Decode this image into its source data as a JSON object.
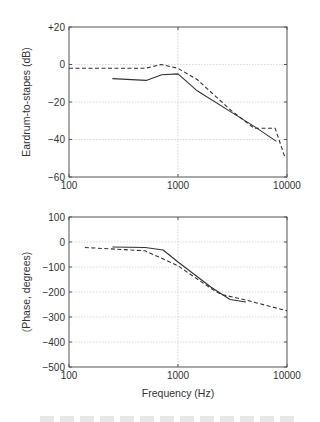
{
  "chart_data": [
    {
      "type": "line",
      "title": "",
      "xlabel": "",
      "ylabel": "Eardrum-to-stapes (dB)",
      "xscale": "log",
      "xlim": [
        100,
        10000
      ],
      "ylim": [
        -60,
        20
      ],
      "xticks": [
        100,
        1000,
        10000
      ],
      "xtick_labels": [
        "100",
        "1000",
        "10000"
      ],
      "yticks": [
        20,
        0,
        -20,
        -40,
        -60
      ],
      "ytick_labels": [
        "+20",
        "0",
        "−20",
        "−40",
        "−60"
      ],
      "grid": true,
      "legend": null,
      "series": [
        {
          "name": "solid",
          "style": "solid",
          "x": [
            250,
            510,
            710,
            1000,
            1500,
            3000,
            5000,
            8000
          ],
          "y": [
            -7.5,
            -8.5,
            -5.5,
            -5,
            -14,
            -25,
            -33,
            -41
          ]
        },
        {
          "name": "dashed",
          "style": "dashed",
          "x": [
            100,
            500,
            700,
            1000,
            1500,
            3000,
            5000,
            7800,
            9500
          ],
          "y": [
            -2,
            -2,
            0,
            -2,
            -8,
            -24,
            -34,
            -34,
            -49
          ]
        }
      ]
    },
    {
      "type": "line",
      "title": "",
      "xlabel": "Frequency (Hz)",
      "ylabel": "(Phase, degrees)",
      "xscale": "log",
      "xlim": [
        100,
        10000
      ],
      "ylim": [
        -500,
        100
      ],
      "xticks": [
        100,
        1000,
        10000
      ],
      "xtick_labels": [
        "100",
        "1000",
        "10000"
      ],
      "yticks": [
        100,
        0,
        -100,
        -200,
        -300,
        -400,
        -500
      ],
      "ytick_labels": [
        "100",
        "0",
        "−100",
        "−200",
        "−300",
        "−400",
        "−500"
      ],
      "grid": true,
      "legend": null,
      "series": [
        {
          "name": "solid",
          "style": "solid",
          "x": [
            250,
            500,
            730,
            1000,
            2000,
            3000,
            4200
          ],
          "y": [
            -20,
            -22,
            -32,
            -80,
            -180,
            -230,
            -240
          ]
        },
        {
          "name": "dashed",
          "style": "dashed",
          "x": [
            140,
            500,
            1000,
            2000,
            2500,
            4000,
            10000
          ],
          "y": [
            -22,
            -35,
            -95,
            -185,
            -210,
            -230,
            -275
          ]
        }
      ]
    }
  ],
  "colors": {
    "axis": "#555555",
    "grid": "#cfcfcf",
    "line": "#333333",
    "phase_label_paren": "#3a9a3a"
  }
}
